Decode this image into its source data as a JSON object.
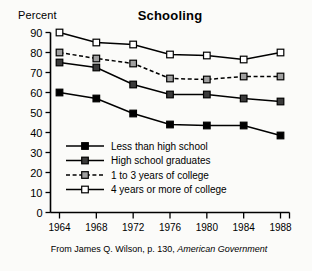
{
  "chart_data": {
    "type": "line",
    "title": "Schooling",
    "ylabel": "Percent",
    "xlabel": "",
    "caption_prefix": "From James Q. Wilson, p. 130, ",
    "caption_italic": "American Government",
    "categories": [
      "1964",
      "1968",
      "1972",
      "1976",
      "1980",
      "1984",
      "1988"
    ],
    "x": [
      1964,
      1968,
      1972,
      1976,
      1980,
      1984,
      1988
    ],
    "ylim": [
      0,
      90
    ],
    "yticks": [
      0,
      10,
      20,
      30,
      40,
      50,
      60,
      70,
      80,
      90
    ],
    "grid": false,
    "legend_position": "inside-lower-left",
    "series": [
      {
        "name": "Less than high school",
        "marker": "filled-square",
        "marker_fill": "#000000",
        "line_style": "solid",
        "values": [
          60,
          57,
          49.5,
          44,
          43.5,
          43.5,
          38.5
        ]
      },
      {
        "name": "High school graduates",
        "marker": "dark-square",
        "marker_fill": "#3a3a3a",
        "line_style": "solid",
        "values": [
          75,
          72.5,
          64,
          59,
          59,
          57,
          55.5
        ]
      },
      {
        "name": "1 to 3 years of college",
        "marker": "gray-square",
        "marker_fill": "#a0a0a0",
        "line_style": "dashed",
        "values": [
          80,
          77,
          74.5,
          67,
          66.5,
          68,
          68
        ]
      },
      {
        "name": "4 years or more of college",
        "marker": "open-square",
        "marker_fill": "#ffffff",
        "line_style": "solid",
        "values": [
          90,
          85,
          84,
          79,
          78.5,
          76.5,
          80
        ]
      }
    ]
  },
  "legend": {
    "items": [
      {
        "label": "Less than high school"
      },
      {
        "label": "High school graduates"
      },
      {
        "label": "1 to 3 years of college"
      },
      {
        "label": "4 years or more of college"
      }
    ]
  }
}
